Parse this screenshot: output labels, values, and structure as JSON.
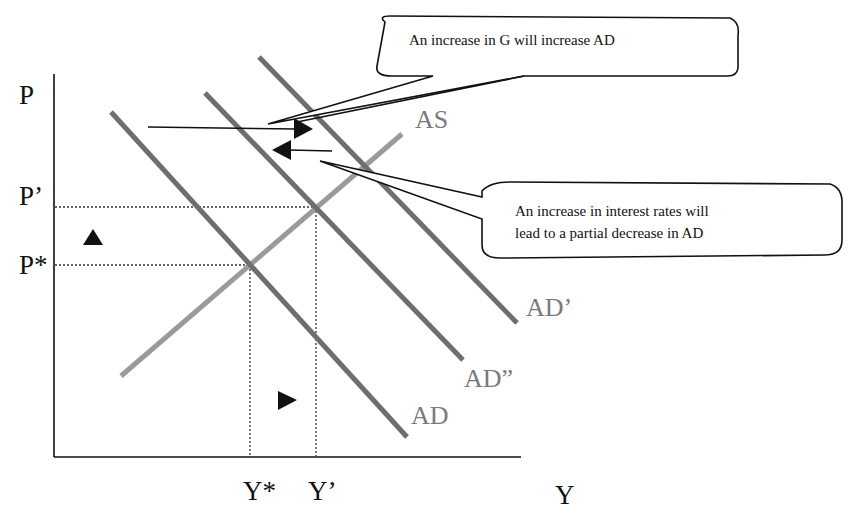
{
  "diagram": {
    "type": "AD-AS model",
    "axes": {
      "y_axis_label": "P",
      "x_axis_label": "Y",
      "y_ticks": [
        "P'",
        "P*"
      ],
      "x_ticks": [
        "Y*",
        "Y'"
      ]
    },
    "curves": {
      "as": "AS",
      "ad": "AD",
      "ad_prime": "AD’",
      "ad_double_prime": "AD”"
    },
    "tick_labels": {
      "p_prime": "P’",
      "p_star": "P*",
      "y_star": "Y*",
      "y_prime": "Y’"
    },
    "callouts": {
      "g_increase": "An increase in G will increase AD",
      "interest_line1": "An increase in interest rates will",
      "interest_line2": "lead to a partial decrease in AD"
    },
    "markers": {
      "price_arrow": "up-triangle",
      "output_arrow": "right-triangle"
    },
    "colors": {
      "ad_curves": "#6e6e6e",
      "as_curve": "#9a9a9a",
      "text": "#111111",
      "curve_labels": "#7a7a7a"
    }
  }
}
